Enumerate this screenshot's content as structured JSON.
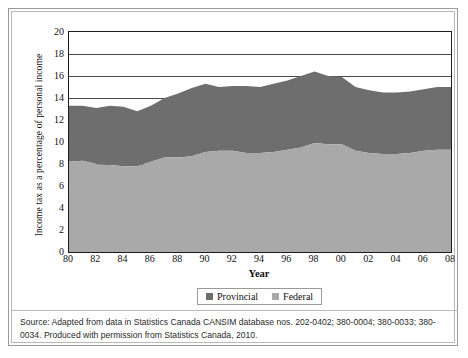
{
  "figure": {
    "source_note": "Source: Adapted from data in Statistics Canada CANSIM database nos. 202-0402; 380-0004; 380-0033; 380-0034. Produced with permission from Statistics Canada, 2010."
  },
  "colors": {
    "provincial": "#6e6e6e",
    "federal": "#a9a9a9",
    "axis": "#1c1c1c",
    "grid": "#4a4a4a"
  },
  "legend": {
    "position": "bottom-center",
    "items": [
      {
        "label": "Provincial",
        "color": "#6e6e6e"
      },
      {
        "label": "Federal",
        "color": "#a9a9a9"
      }
    ]
  },
  "chart_data": {
    "type": "area",
    "stacked": true,
    "title": "",
    "xlabel": "Year",
    "ylabel": "Income tax as a percentage of personal income",
    "xlim": [
      1980,
      2008
    ],
    "ylim": [
      0,
      20
    ],
    "ytick_step": 2,
    "grid": true,
    "x": [
      1980,
      1981,
      1982,
      1983,
      1984,
      1985,
      1986,
      1987,
      1988,
      1989,
      1990,
      1991,
      1992,
      1993,
      1994,
      1995,
      1996,
      1997,
      1998,
      1999,
      2000,
      2001,
      2002,
      2003,
      2004,
      2005,
      2006,
      2007,
      2008
    ],
    "xtick_labels": [
      "80",
      "82",
      "84",
      "86",
      "88",
      "90",
      "92",
      "94",
      "96",
      "98",
      "00",
      "02",
      "04",
      "06",
      "08"
    ],
    "ytick_labels": [
      "0",
      "2",
      "4",
      "6",
      "8",
      "10",
      "12",
      "14",
      "16",
      "18",
      "20"
    ],
    "series": [
      {
        "name": "Federal",
        "color": "#a9a9a9",
        "order": "bottom",
        "values": [
          8.2,
          8.3,
          8.0,
          7.9,
          7.8,
          7.8,
          8.2,
          8.6,
          8.6,
          8.7,
          9.1,
          9.2,
          9.2,
          9.0,
          9.0,
          9.1,
          9.3,
          9.5,
          9.9,
          9.8,
          9.8,
          9.2,
          9.0,
          8.9,
          8.9,
          9.0,
          9.2,
          9.3,
          9.3
        ]
      },
      {
        "name": "Provincial",
        "color": "#6e6e6e",
        "order": "top",
        "values": [
          5.1,
          5.0,
          5.1,
          5.4,
          5.4,
          5.0,
          5.1,
          5.4,
          5.8,
          6.2,
          6.2,
          5.8,
          5.9,
          6.1,
          6.0,
          6.2,
          6.3,
          6.5,
          6.5,
          6.2,
          6.1,
          5.8,
          5.7,
          5.6,
          5.6,
          5.6,
          5.6,
          5.7,
          5.7
        ]
      }
    ],
    "totals": [
      13.3,
      13.3,
      13.1,
      13.3,
      13.2,
      12.8,
      13.3,
      14.0,
      14.4,
      14.9,
      15.3,
      15.0,
      15.1,
      15.1,
      15.0,
      15.3,
      15.6,
      16.0,
      16.4,
      16.0,
      15.9,
      15.0,
      14.7,
      14.5,
      14.5,
      14.6,
      14.8,
      15.0,
      15.0
    ]
  }
}
